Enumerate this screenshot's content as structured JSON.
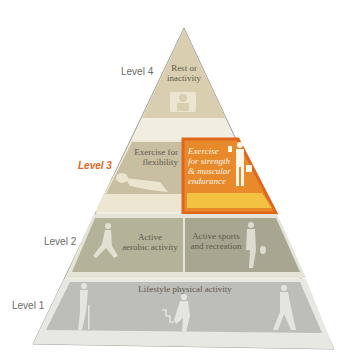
{
  "colors": {
    "highlight": "#e0661c",
    "highlight_fill": "#e8892c",
    "level4": "#d9cfb0",
    "level3": "#c8bea2",
    "level2": "#b5b29a",
    "level1": "#bdbdb9",
    "outline": "#8a8a84",
    "label": "#6b6b66"
  },
  "levels": [
    {
      "label": "Level 4",
      "cells": [
        {
          "label_lines": [
            "Rest or",
            "inactivity"
          ],
          "icon": "person-at-computer-icon"
        }
      ]
    },
    {
      "label": "Level 3",
      "highlighted": true,
      "cells": [
        {
          "label_lines": [
            "Exercise for",
            "flexibility"
          ],
          "icon": "stretching-person-icon"
        },
        {
          "label_lines": [
            "Exercise",
            "for strength",
            "& muscular",
            "endurance"
          ],
          "icon": "weightlifter-icon",
          "highlighted": true
        }
      ]
    },
    {
      "label": "Level 2",
      "cells": [
        {
          "label_lines": [
            "Active",
            "aerobic activity"
          ],
          "icon": "runner-icon"
        },
        {
          "label_lines": [
            "Active sports",
            "and recreation"
          ],
          "icon": "tennis-player-icon"
        }
      ]
    },
    {
      "label": "Level 1",
      "cells": [
        {
          "label_lines": [
            "Lifestyle physical activity"
          ],
          "icons": [
            "elderly-walker-icon",
            "stair-climber-icon",
            "walker-icon"
          ]
        }
      ]
    }
  ]
}
